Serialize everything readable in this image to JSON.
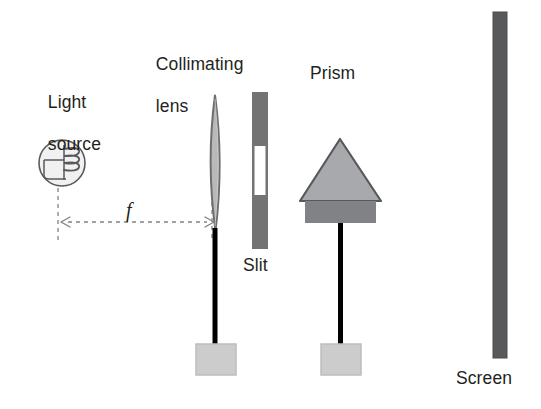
{
  "figure": {
    "title_visible": false,
    "background_color": "#ffffff",
    "text_color": "#231f20",
    "width": 541,
    "height": 409
  },
  "labels": {
    "light_source_line1": "Light",
    "light_source_line2": "source",
    "collimating_lens_line1": "Collimating",
    "collimating_lens_line2": "lens",
    "focal_length": "f",
    "slit": "Slit",
    "prism": "Prism",
    "screen": "Screen"
  },
  "components": {
    "light_source": {
      "name": "Light source",
      "shape": "circle-bulb-with-filament",
      "cx": 62,
      "cy": 163,
      "r": 23,
      "fill": "#f1f1f1",
      "stroke": "#58595b"
    },
    "collimating_lens": {
      "name": "Collimating lens",
      "shape": "biconvex-lens",
      "cx": 215,
      "top": 95,
      "bottom": 232,
      "half_width": 7,
      "fill": "#b9b9b9",
      "stroke": "#6d6e71"
    },
    "slit": {
      "name": "Slit",
      "shape": "vertical-bar-with-aperture",
      "x": 252,
      "y": 92,
      "width": 16,
      "height": 157,
      "fill": "#737373",
      "aperture_y": 146,
      "aperture_height": 49,
      "aperture_fill": "#ffffff"
    },
    "prism": {
      "name": "Prism",
      "shape": "triangle-on-base",
      "apex_x": 340,
      "apex_y": 139,
      "base_left_x": 300,
      "base_right_x": 381,
      "base_y": 201,
      "triangle_fill": "#a7a9ac",
      "triangle_stroke": "#58595b",
      "mount_x": 305,
      "mount_y": 201,
      "mount_width": 71,
      "mount_height": 22,
      "mount_fill": "#808285"
    },
    "screen": {
      "name": "Screen",
      "shape": "vertical-bar",
      "x": 493,
      "y": 12,
      "width": 14,
      "height": 346,
      "fill": "#58595b",
      "stroke": "#414042"
    },
    "lens_post": {
      "name": "Lens support post",
      "x": 213,
      "y": 230,
      "width": 5,
      "height": 115,
      "fill": "#000000"
    },
    "prism_post": {
      "name": "Prism support post",
      "x": 338,
      "y": 223,
      "width": 5,
      "height": 122,
      "fill": "#000000"
    },
    "lens_base": {
      "name": "Lens stand base",
      "x": 196,
      "y": 344,
      "width": 39,
      "height": 30,
      "fill": "#cccccc",
      "stroke": "#bcbcbc"
    },
    "prism_base": {
      "name": "Prism stand base",
      "x": 321,
      "y": 344,
      "width": 39,
      "height": 30,
      "fill": "#cccccc",
      "stroke": "#bcbcbc"
    }
  },
  "annotations": {
    "focal_arrow": {
      "label": "f",
      "description": "Dashed double-headed arrow marking focal length from light source to lens",
      "x_start": 62,
      "x_end": 213,
      "y": 222,
      "color": "#808285",
      "style": "dashed"
    },
    "guide_line_source": {
      "x": 58,
      "y_top": 188,
      "y_bottom": 240,
      "color": "#808285",
      "style": "dashed"
    },
    "guide_line_lens": {
      "x": 212,
      "y_top": 170,
      "y_bottom": 240,
      "color": "#808285",
      "style": "dashed"
    }
  },
  "label_positions": {
    "light_source": {
      "x": 28,
      "y": 71
    },
    "collimating_lens": {
      "x": 136,
      "y": 33
    },
    "focal_length": {
      "x": 126,
      "y": 200
    },
    "slit": {
      "x": 243,
      "y": 255
    },
    "prism": {
      "x": 310,
      "y": 63
    },
    "screen": {
      "x": 456,
      "y": 368
    }
  }
}
